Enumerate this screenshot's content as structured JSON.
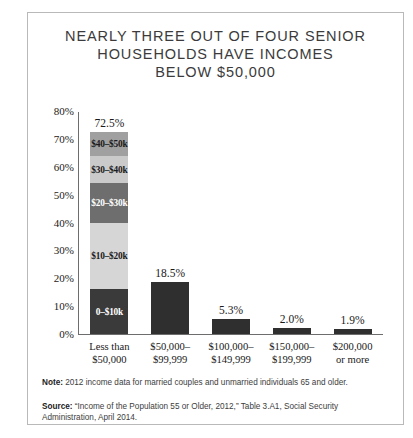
{
  "chart_data": {
    "type": "bar",
    "title": "NEARLY THREE OUT OF FOUR SENIOR\nHOUSEHOLDS HAVE INCOMES\nBELOW $50,000",
    "xlabel": "",
    "ylabel": "",
    "ylim": [
      0,
      80
    ],
    "grid": false,
    "legend": "none",
    "ytick_labels": [
      "80%",
      "70%",
      "60%",
      "50%",
      "40%",
      "30%",
      "20%",
      "10%",
      "0%"
    ],
    "ytick_values": [
      80,
      70,
      60,
      50,
      40,
      30,
      20,
      10,
      0
    ],
    "categories": [
      "Less than\n$50,000",
      "$50,000–\n$99,999",
      "$100,000–\n$149,999",
      "$150,000–\n$199,999",
      "$200,000\nor more"
    ],
    "values": [
      72.5,
      18.5,
      5.3,
      2.0,
      1.9
    ],
    "value_labels": [
      "72.5%",
      "18.5%",
      "5.3%",
      "2.0%",
      "1.9%"
    ],
    "stacked_first_bar": {
      "total": 72.5,
      "segments": [
        {
          "label": "$40–$50k",
          "value": 8.5,
          "color": "#a0a0a0"
        },
        {
          "label": "$30–$40k",
          "value": 10.0,
          "color": "#cacaca"
        },
        {
          "label": "$20–$30k",
          "value": 14.0,
          "color": "#6e6e6e"
        },
        {
          "label": "$10–$20k",
          "value": 24.0,
          "color": "#d6d6d6"
        },
        {
          "label": "0–$10k",
          "value": 16.0,
          "color": "#3a3a3a"
        }
      ]
    },
    "bar_color": "#2f2f2f",
    "axis_color": "#6d6d6d"
  },
  "footnotes": {
    "note_lead": "Note:",
    "note_text": " 2012 income data for married couples and unmarried individuals 65 and older.",
    "source_lead": "Source:",
    "source_text": " “Income of the Population 55 or Older, 2012,” Table 3.A1, Social Security Administration, April 2014."
  }
}
